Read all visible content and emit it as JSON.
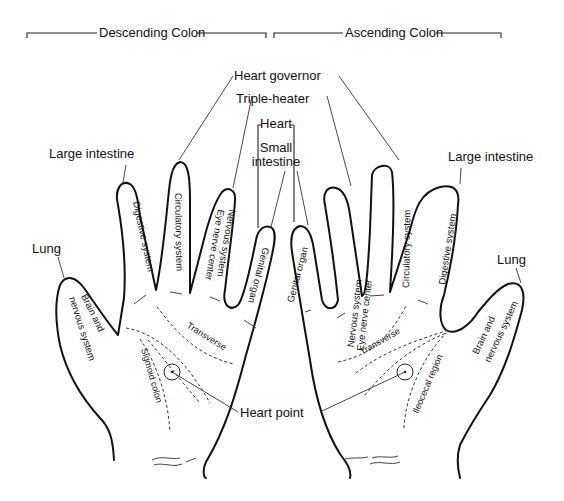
{
  "brackets": {
    "left": "Descending Colon",
    "right": "Ascending Colon"
  },
  "top_labels": {
    "heart_governor": "Heart governor",
    "triple_heater": "Triple-heater",
    "heart": "Heart",
    "small_intestine_1": "Small",
    "small_intestine_2": "intestine"
  },
  "left_hand": {
    "large_intestine": "Large intestine",
    "lung": "Lung",
    "fingers": {
      "index": "Digestive system",
      "middle": "Circulatory system",
      "ring_1": "Nervous system",
      "ring_2": "Eye nerve center",
      "little": "Genital organ",
      "thumb_1": "Brain and",
      "thumb_2": "nervous system"
    },
    "palm": {
      "transverse": "Transverse",
      "sigmoid": "Sigmoid colon"
    }
  },
  "right_hand": {
    "large_intestine": "Large intestine",
    "lung": "Lung",
    "fingers": {
      "little": "Genital organ",
      "ring_1": "Nervous system",
      "ring_2": "Eye nerve center",
      "middle": "Circulatory system",
      "index": "Digestive system",
      "thumb_1": "Brain and",
      "thumb_2": "nervous system"
    },
    "palm": {
      "transverse": "Transverse",
      "ileocecal": "Ileocecal region"
    }
  },
  "heart_point": "Heart point"
}
